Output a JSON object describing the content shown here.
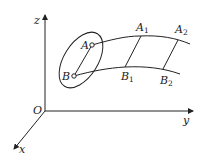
{
  "diagram": {
    "type": "3d-coordinate-flow-diagram",
    "axes": {
      "origin_label": "O",
      "x_label": "x",
      "y_label": "y",
      "z_label": "z"
    },
    "points": {
      "A": "A",
      "B": "B",
      "A1": "A",
      "A1_sub": "1",
      "A2": "A",
      "A2_sub": "2",
      "B1": "B",
      "B1_sub": "1",
      "B2": "B",
      "B2_sub": "2"
    },
    "colors": {
      "stroke": "#222222",
      "background": "#ffffff"
    }
  }
}
